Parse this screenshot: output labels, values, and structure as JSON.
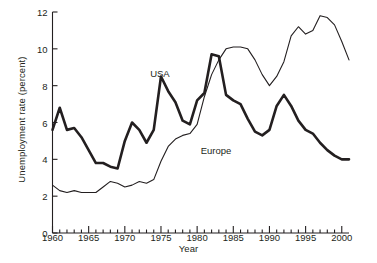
{
  "chart_data": {
    "type": "line",
    "title": "",
    "xlabel": "Year",
    "ylabel": "Unemployment rate (percent)",
    "xlim": [
      1960,
      2001
    ],
    "ylim": [
      0,
      12
    ],
    "grid": false,
    "legend_position": "inline-annotations",
    "xticks_major": [
      1960,
      1965,
      1970,
      1975,
      1980,
      1985,
      1990,
      1995,
      2000
    ],
    "xtick_labels": [
      "1960",
      "1965",
      "1970",
      "1975",
      "1980",
      "1985",
      "1990",
      "1995",
      "2000"
    ],
    "xtick_minor_step": 1,
    "yticks": [
      0,
      2,
      4,
      6,
      8,
      10,
      12
    ],
    "ytick_labels": [
      "0",
      "2",
      "4",
      "6",
      "8",
      "10",
      "12"
    ],
    "x": [
      1960,
      1961,
      1962,
      1963,
      1964,
      1965,
      1966,
      1967,
      1968,
      1969,
      1970,
      1971,
      1972,
      1973,
      1974,
      1975,
      1976,
      1977,
      1978,
      1979,
      1980,
      1981,
      1982,
      1983,
      1984,
      1985,
      1986,
      1987,
      1988,
      1989,
      1990,
      1991,
      1992,
      1993,
      1994,
      1995,
      1996,
      1997,
      1998,
      1999,
      2000,
      2001
    ],
    "series": [
      {
        "name": "USA",
        "label_text": "USA",
        "color": "#231f20",
        "line_width": 2.6,
        "values": [
          5.6,
          6.8,
          5.6,
          5.7,
          5.2,
          4.5,
          3.8,
          3.8,
          3.6,
          3.5,
          5.0,
          6.0,
          5.6,
          4.9,
          5.6,
          8.5,
          7.7,
          7.1,
          6.1,
          5.9,
          7.2,
          7.6,
          9.7,
          9.6,
          7.5,
          7.2,
          7.0,
          6.2,
          5.5,
          5.3,
          5.6,
          6.9,
          7.5,
          6.9,
          6.1,
          5.6,
          5.4,
          4.9,
          4.5,
          4.2,
          4.0,
          4.0
        ]
      },
      {
        "name": "Europe",
        "label_text": "Europe",
        "color": "#231f20",
        "line_width": 1.1,
        "values": [
          2.6,
          2.3,
          2.2,
          2.3,
          2.2,
          2.2,
          2.2,
          2.5,
          2.8,
          2.7,
          2.5,
          2.6,
          2.8,
          2.7,
          2.9,
          3.9,
          4.7,
          5.1,
          5.3,
          5.4,
          5.9,
          7.4,
          8.6,
          9.4,
          10.0,
          10.1,
          10.1,
          10.0,
          9.4,
          8.6,
          8.0,
          8.5,
          9.3,
          10.7,
          11.2,
          10.8,
          11.0,
          11.8,
          11.7,
          11.3,
          10.4,
          9.4
        ]
      }
    ],
    "annotations": [
      {
        "text": "USA",
        "x": 1973.5,
        "y": 8.65
      },
      {
        "text": "Europe",
        "x": 1980.5,
        "y": 4.45
      }
    ]
  }
}
